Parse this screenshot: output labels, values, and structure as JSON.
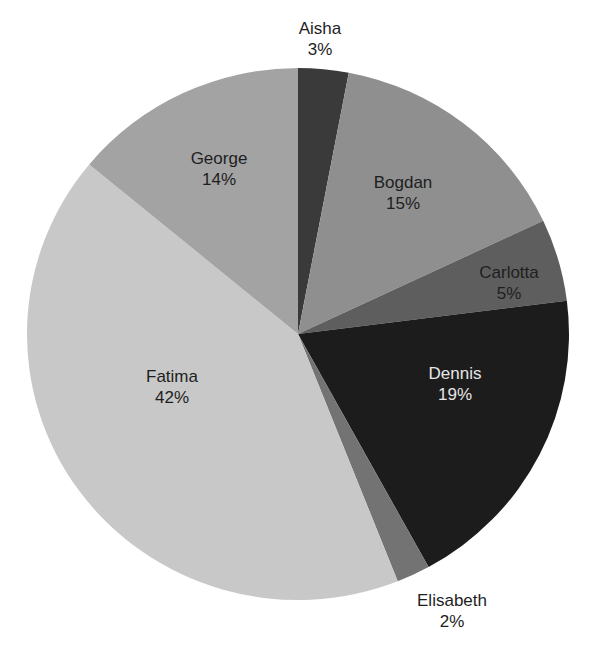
{
  "chart_data": {
    "type": "pie",
    "title": "",
    "start_angle": "12 o'clock",
    "direction": "clockwise",
    "categories": [
      "Aisha",
      "Bogdan",
      "Carlotta",
      "Dennis",
      "Elisabeth",
      "Fatima",
      "George"
    ],
    "values": [
      3,
      15,
      5,
      19,
      2,
      42,
      14
    ],
    "unit": "%",
    "colors": [
      "#3a3a3a",
      "#8f8f8f",
      "#5e5e5e",
      "#1c1c1c",
      "#737373",
      "#c8c8c8",
      "#a3a3a3"
    ],
    "legend": "none",
    "labels_inside": true
  },
  "labels": [
    {
      "name": "Aisha",
      "pct": "3%"
    },
    {
      "name": "Bogdan",
      "pct": "15%"
    },
    {
      "name": "Carlotta",
      "pct": "5%"
    },
    {
      "name": "Dennis",
      "pct": "19%"
    },
    {
      "name": "Elisabeth",
      "pct": "2%"
    },
    {
      "name": "Fatima",
      "pct": "42%"
    },
    {
      "name": "George",
      "pct": "14%"
    }
  ]
}
